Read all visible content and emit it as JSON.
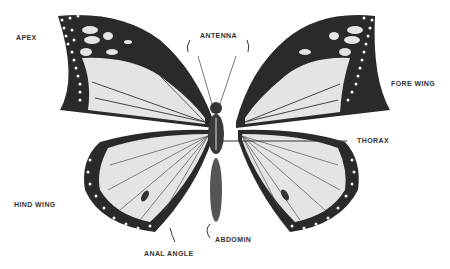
{
  "diagram": {
    "labels": {
      "apex": "APEX",
      "antenna": "ANTENNA",
      "fore_wing": "FORE WING",
      "thorax": "THORAX",
      "hind_wing": "HIND WING",
      "anal_angle": "ANAL ANGLE",
      "abdomen": "ABDOMIN"
    },
    "colors": {
      "background": "#ffffff",
      "wing_border": "#2a2a2a",
      "wing_cell": "#e4e4e4",
      "spots": "#f2f2f2",
      "label_text": "#333333"
    }
  }
}
